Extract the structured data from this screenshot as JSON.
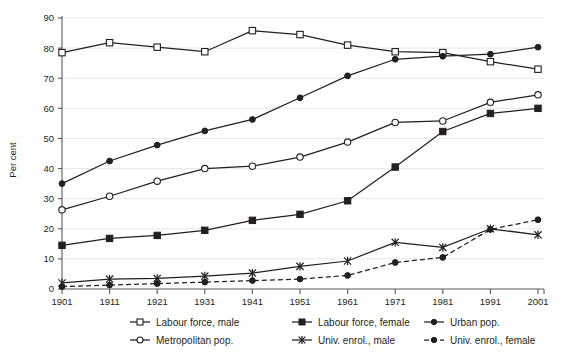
{
  "chart_data": {
    "type": "line",
    "title": "",
    "xlabel": "",
    "ylabel": "Per cent",
    "ylim": [
      0,
      90
    ],
    "ytick_step": 10,
    "grid": true,
    "legend_position": "bottom",
    "categories": [
      "1901",
      "1911",
      "1921",
      "1931",
      "1941",
      "1951",
      "1961",
      "1971",
      "1981",
      "1991",
      "2001"
    ],
    "series": [
      {
        "name": "Labour force, male",
        "marker": "open-square",
        "line": "solid",
        "values": [
          78.5,
          81.8,
          80.3,
          78.8,
          85.8,
          84.5,
          81.0,
          78.8,
          78.5,
          75.5,
          73.0
        ]
      },
      {
        "name": "Labour force, female",
        "marker": "filled-square",
        "line": "solid",
        "values": [
          14.5,
          16.8,
          17.8,
          19.5,
          22.8,
          24.8,
          29.3,
          40.5,
          52.3,
          58.3,
          60.0
        ]
      },
      {
        "name": "Urban pop.",
        "marker": "filled-circle",
        "line": "solid",
        "values": [
          35.0,
          42.5,
          47.8,
          52.5,
          56.3,
          63.5,
          70.8,
          76.3,
          77.3,
          78.0,
          80.3
        ]
      },
      {
        "name": "Metropolitan pop.",
        "marker": "open-circle",
        "line": "solid",
        "values": [
          26.3,
          30.8,
          35.8,
          40.0,
          40.8,
          43.8,
          48.8,
          55.3,
          55.8,
          62.0,
          64.5
        ]
      },
      {
        "name": "Univ. enrol., male",
        "marker": "star",
        "line": "solid",
        "values": [
          2.0,
          3.3,
          3.5,
          4.3,
          5.3,
          7.5,
          9.3,
          15.5,
          13.8,
          20.0,
          18.0
        ]
      },
      {
        "name": "Univ. enrol., female",
        "marker": "filled-circle",
        "line": "dashed",
        "values": [
          0.8,
          1.3,
          1.8,
          2.3,
          2.8,
          3.3,
          4.5,
          8.8,
          10.5,
          19.8,
          23.0
        ]
      }
    ],
    "ytick_labels": [
      "0",
      "10",
      "20",
      "30",
      "40",
      "50",
      "60",
      "70",
      "80",
      "90"
    ]
  },
  "legend": {
    "items": [
      {
        "label": "Labour force, male"
      },
      {
        "label": "Labour force, female"
      },
      {
        "label": "Urban pop."
      },
      {
        "label": "Metropolitan pop."
      },
      {
        "label": "Univ. enrol., male"
      },
      {
        "label": "Univ. enrol., female"
      }
    ]
  },
  "colors": {
    "ink": "#231f20",
    "axis": "#58595b",
    "grid": "#e8e8e8",
    "background": "#ffffff"
  }
}
